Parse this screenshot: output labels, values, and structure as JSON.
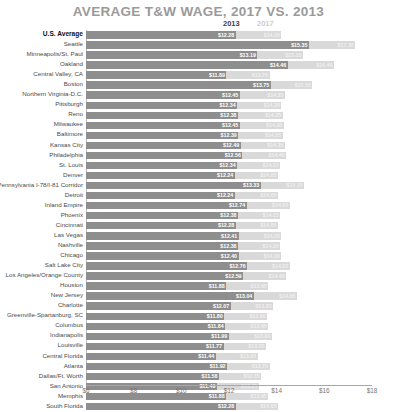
{
  "chart_data": {
    "type": "bar",
    "orientation": "horizontal",
    "title": "AVERAGE T&W WAGE, 2017 VS. 2013",
    "xlabel": "",
    "ylabel": "",
    "xlim": [
      6,
      18
    ],
    "xticks": [
      "$6",
      "$8",
      "$10",
      "$12",
      "$14",
      "$16",
      "$18"
    ],
    "xtick_values": [
      6,
      8,
      10,
      12,
      14,
      16,
      18
    ],
    "grid": false,
    "legend_position": "top",
    "legend": [
      "2013",
      "2017"
    ],
    "highlight_category": "U.S. Average",
    "colors": {
      "series_2013": "#8e8e8e",
      "series_2017": "#d9d9d9",
      "title": "#9a9a9a",
      "axis": "#a8a8a8"
    },
    "categories": [
      "U.S. Average",
      "Seattle",
      "Minneapolis/St. Paul",
      "Oakland",
      "Central Valley, CA",
      "Boston",
      "Northern Virginia-D.C.",
      "Pittsburgh",
      "Reno",
      "Milwaukee",
      "Baltimore",
      "Kansas City",
      "Philadelphia",
      "St. Louis",
      "Denver",
      "Pennsylvania I-78/I-81 Corridor",
      "Detroit",
      "Inland Empire",
      "Phoenix",
      "Cincinnati",
      "Las Vegas",
      "Nashville",
      "Chicago",
      "Salt Lake City",
      "Los Angeles/Orange County",
      "Houston",
      "New Jersey",
      "Charlotte",
      "Greenville-Spartanburg, SC",
      "Columbus",
      "Indianapolis",
      "Louisville",
      "Central Florida",
      "Atlanta",
      "Dallas/Ft. Worth",
      "San Antonio",
      "Memphis",
      "South Florida"
    ],
    "series": [
      {
        "name": "2013",
        "values": [
          12.28,
          15.35,
          13.19,
          14.46,
          11.89,
          13.75,
          12.45,
          12.34,
          12.38,
          12.45,
          12.39,
          12.49,
          12.56,
          12.34,
          12.24,
          13.33,
          12.24,
          12.74,
          12.38,
          12.28,
          12.41,
          12.38,
          12.4,
          12.76,
          12.59,
          11.88,
          13.04,
          12.07,
          11.8,
          11.84,
          11.99,
          11.77,
          11.44,
          11.92,
          11.58,
          11.49,
          11.88,
          12.28
        ],
        "labels": [
          "$12.28",
          "$15.35",
          "$13.19",
          "$14.46",
          "$11.89",
          "$13.75",
          "$12.45",
          "$12.34",
          "$12.38",
          "$12.45",
          "$12.39",
          "$12.49",
          "$12.56",
          "$12.34",
          "$12.24",
          "$13.33",
          "$12.24",
          "$12.74",
          "$12.38",
          "$12.28",
          "$12.41",
          "$12.38",
          "$12.40",
          "$12.76",
          "$12.59",
          "$11.88",
          "$13.04",
          "$12.07",
          "$11.80",
          "$11.84",
          "$11.99",
          "$11.77",
          "$11.44",
          "$11.92",
          "$11.58",
          "$11.49",
          "$11.88",
          "$12.28"
        ]
      },
      {
        "name": "2017",
        "values": [
          14.2,
          17.3,
          15.1,
          16.4,
          13.7,
          15.5,
          14.35,
          14.2,
          14.25,
          14.3,
          14.25,
          14.35,
          14.4,
          14.15,
          14.05,
          15.15,
          14.05,
          14.55,
          14.15,
          14.05,
          14.2,
          14.15,
          14.2,
          14.55,
          14.4,
          13.65,
          14.85,
          13.85,
          13.6,
          13.65,
          13.8,
          13.55,
          13.2,
          13.7,
          13.35,
          13.25,
          13.65,
          14.05
        ],
        "labels": [
          "$14.20",
          "$17.30",
          "$15.10",
          "$16.40",
          "$13.70",
          "$15.50",
          "$14.35",
          "$14.20",
          "$14.25",
          "$14.30",
          "$14.25",
          "$14.35",
          "$14.40",
          "$14.15",
          "$14.05",
          "$15.15",
          "$14.05",
          "$14.55",
          "$14.15",
          "$14.05",
          "$14.20",
          "$14.15",
          "$14.20",
          "$14.55",
          "$14.40",
          "$13.65",
          "$14.85",
          "$13.85",
          "$13.60",
          "$13.65",
          "$13.80",
          "$13.55",
          "$13.20",
          "$13.70",
          "$13.35",
          "$13.25",
          "$13.65",
          "$14.05"
        ]
      }
    ]
  }
}
